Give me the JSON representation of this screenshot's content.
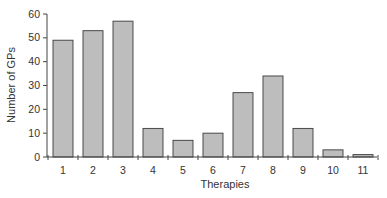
{
  "chart_data": {
    "type": "bar",
    "title": "",
    "xlabel": "Therapies",
    "ylabel": "Number of GPs",
    "categories": [
      "1",
      "2",
      "3",
      "4",
      "5",
      "6",
      "7",
      "8",
      "9",
      "10",
      "11"
    ],
    "values": [
      49,
      53,
      57,
      12,
      7,
      10,
      27,
      34,
      12,
      3,
      1
    ],
    "ylim": [
      0,
      60
    ],
    "yticks": [
      0,
      10,
      20,
      30,
      40,
      50,
      60
    ],
    "grid": false,
    "legend": null,
    "bar_color": "#bdbdbd",
    "bar_edge_color": "#3a3a3a"
  }
}
